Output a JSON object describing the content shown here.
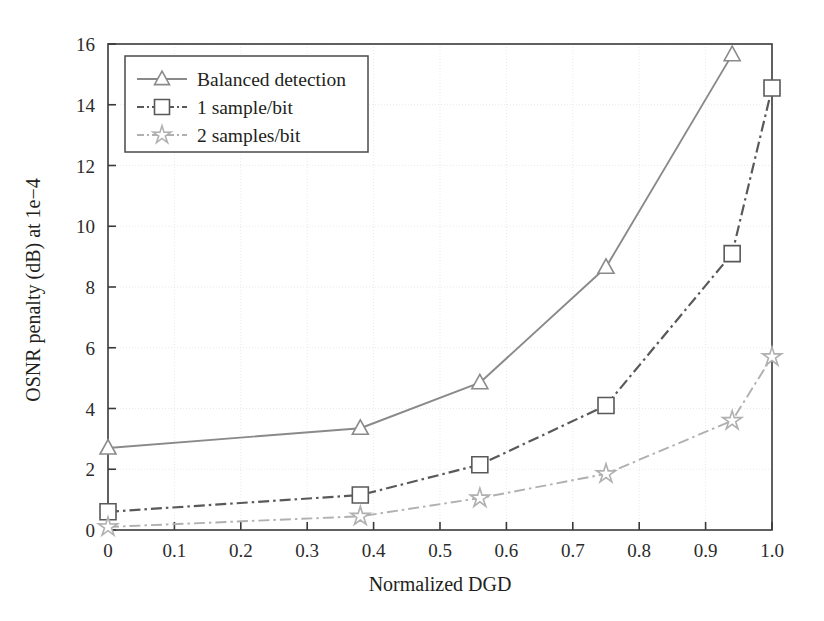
{
  "chart_data": {
    "type": "line",
    "title": "",
    "xlabel": "Normalized DGD",
    "ylabel": "OSNR penalty (dB) at 1e−4",
    "xlim": [
      0,
      1.0
    ],
    "ylim": [
      0,
      16
    ],
    "xticks": [
      "0",
      "0.1",
      "0.2",
      "0.3",
      "0.4",
      "0.5",
      "0.6",
      "0.7",
      "0.8",
      "0.9",
      "1.0"
    ],
    "xtick_values": [
      0,
      0.1,
      0.2,
      0.3,
      0.4,
      0.5,
      0.6,
      0.7,
      0.8,
      0.9,
      1.0
    ],
    "yticks": [
      "0",
      "2",
      "4",
      "6",
      "8",
      "10",
      "12",
      "14",
      "16"
    ],
    "ytick_values": [
      0,
      2,
      4,
      6,
      8,
      10,
      12,
      14,
      16
    ],
    "grid": true,
    "grid_style": "dotted",
    "legend_position": "upper left",
    "series": [
      {
        "name": "Balanced detection",
        "marker": "triangle",
        "line_style": "solid",
        "color": "#8a8a8a",
        "x": [
          0.0,
          0.38,
          0.56,
          0.75,
          0.94
        ],
        "values": [
          2.7,
          3.35,
          4.85,
          8.65,
          15.65
        ]
      },
      {
        "name": "1 sample/bit",
        "marker": "square",
        "line_style": "dashdot",
        "color": "#595959",
        "x": [
          0.0,
          0.38,
          0.56,
          0.75,
          0.94,
          1.0
        ],
        "values": [
          0.6,
          1.15,
          2.15,
          4.1,
          9.1,
          14.55
        ]
      },
      {
        "name": "2 samples/bit",
        "marker": "star",
        "line_style": "dashdot",
        "color": "#b0b0b0",
        "x": [
          0.0,
          0.38,
          0.56,
          0.75,
          0.94,
          1.0
        ],
        "values": [
          0.1,
          0.45,
          1.05,
          1.85,
          3.6,
          5.7
        ]
      }
    ]
  },
  "legend": {
    "entries": [
      {
        "label": "Balanced detection"
      },
      {
        "label": "1 sample/bit"
      },
      {
        "label": "2 samples/bit"
      }
    ]
  },
  "axes": {
    "x_title": "Normalized DGD",
    "y_title": "OSNR penalty (dB) at 1e−4"
  },
  "colors": {
    "series1": "#8a8a8a",
    "series2": "#595959",
    "series3": "#b0b0b0",
    "axis": "#3a3a3a",
    "grid": "#e9e9e9",
    "text": "#231f20",
    "background": "#ffffff"
  }
}
